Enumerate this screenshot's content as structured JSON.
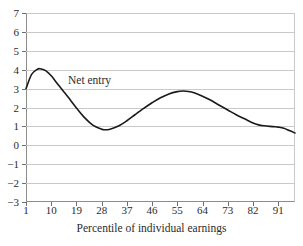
{
  "chart_data": {
    "type": "line",
    "title": "",
    "subtitle": "",
    "xlabel": "Percentile of individual earnings",
    "ylabel": "",
    "xlim": [
      1,
      97
    ],
    "ylim": [
      -3,
      7
    ],
    "grid": true,
    "grid_axis": "y",
    "legend": false,
    "annotations": [
      {
        "text": "Net entry",
        "x_percentile": 16,
        "y_value": 3.45
      }
    ],
    "x_ticks": [
      1,
      10,
      19,
      28,
      37,
      46,
      55,
      64,
      73,
      82,
      91
    ],
    "x_tick_labels": [
      "1",
      "10",
      "19",
      "28",
      "37",
      "46",
      "55",
      "64",
      "73",
      "82",
      "91"
    ],
    "y_ticks": [
      -3,
      -2,
      -1,
      0,
      1,
      2,
      3,
      4,
      5,
      6,
      7
    ],
    "y_tick_labels": [
      "−3",
      "−2",
      "−1",
      "0",
      "1",
      "2",
      "3",
      "4",
      "5",
      "6",
      "7"
    ],
    "series": [
      {
        "name": "Net entry",
        "color": "#1a1a1a",
        "line_width": 1.6,
        "x": [
          1,
          3,
          5,
          6,
          8,
          10,
          12,
          14,
          16,
          19,
          22,
          25,
          28,
          29,
          31,
          34,
          37,
          40,
          43,
          46,
          49,
          52,
          55,
          57,
          59,
          61,
          64,
          67,
          70,
          73,
          76,
          79,
          82,
          84,
          86,
          88,
          90,
          91,
          93,
          95,
          97
        ],
        "y": [
          3.0,
          3.75,
          4.02,
          4.05,
          3.95,
          3.68,
          3.3,
          2.92,
          2.55,
          1.98,
          1.45,
          1.05,
          0.85,
          0.82,
          0.85,
          1.02,
          1.3,
          1.63,
          1.95,
          2.25,
          2.52,
          2.72,
          2.84,
          2.87,
          2.85,
          2.78,
          2.6,
          2.38,
          2.12,
          1.87,
          1.62,
          1.4,
          1.18,
          1.08,
          1.03,
          1.0,
          0.98,
          0.96,
          0.9,
          0.78,
          0.65
        ]
      }
    ]
  }
}
